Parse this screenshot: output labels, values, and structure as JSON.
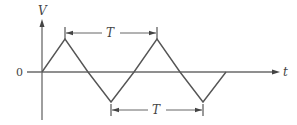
{
  "diagram": {
    "type": "triangle-waveform",
    "labels": {
      "y_axis": "V",
      "x_axis": "t",
      "origin": "0",
      "period_top": "T",
      "period_bottom": "T"
    },
    "colors": {
      "line": "#555555",
      "background": "#ffffff"
    },
    "waveform_points": [
      [
        42,
        72
      ],
      [
        65,
        39
      ],
      [
        88,
        72
      ],
      [
        111,
        102
      ],
      [
        134,
        72
      ],
      [
        157,
        39
      ],
      [
        180,
        72
      ],
      [
        203,
        102
      ],
      [
        226,
        72
      ]
    ],
    "period_annotations": [
      {
        "label": "T",
        "from": "peak 1",
        "to": "peak 2",
        "position": "above"
      },
      {
        "label": "T",
        "from": "trough 1",
        "to": "trough 2",
        "position": "below"
      }
    ]
  }
}
